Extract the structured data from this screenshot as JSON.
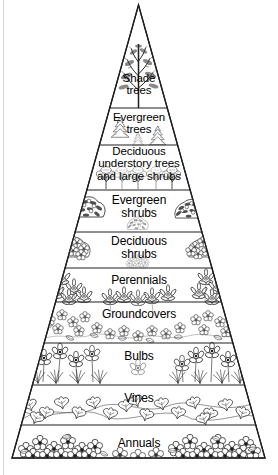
{
  "diagram": {
    "type": "plant-pyramid",
    "orientation": "apex-top",
    "style": "black-and-white line art",
    "stroke_color": "#1a1a1a",
    "fill_color": "#ffffff",
    "text_color": "#000000",
    "tier_count": 10,
    "tiers": [
      {
        "index": 1,
        "label": "Shade\ntrees",
        "label_lines": [
          "Shade",
          "trees"
        ],
        "illustration": "tall-deciduous-tree",
        "font_size": 11.5,
        "text_top": 72,
        "band_top": 5,
        "band_bottom": 108
      },
      {
        "index": 2,
        "label": "Evergreen\ntrees",
        "label_lines": [
          "Evergreen",
          "trees"
        ],
        "illustration": "conifer-evergreen-trees",
        "font_size": 11.5,
        "text_top": 111,
        "band_top": 108,
        "band_bottom": 145
      },
      {
        "index": 3,
        "label": "Deciduous\nunderstory trees\nand large shrubs",
        "label_lines": [
          "Deciduous",
          "understory trees",
          "and large shrubs"
        ],
        "illustration": "understory-trees-large-shrubs",
        "font_size": 11.5,
        "text_top": 145,
        "band_top": 145,
        "band_bottom": 190
      },
      {
        "index": 4,
        "label": "Evergreen\nshrubs",
        "label_lines": [
          "Evergreen",
          "shrubs"
        ],
        "illustration": "broadleaf-evergreen-shrub",
        "font_size": 12,
        "text_top": 194,
        "band_top": 190,
        "band_bottom": 232
      },
      {
        "index": 5,
        "label": "Deciduous\nshrubs",
        "label_lines": [
          "Deciduous",
          "shrubs"
        ],
        "illustration": "flowering-deciduous-shrub",
        "font_size": 12,
        "text_top": 235,
        "band_top": 232,
        "band_bottom": 268
      },
      {
        "index": 6,
        "label": "Perennials",
        "label_lines": [
          "Perennials"
        ],
        "illustration": "daisy-perennial-clumps",
        "font_size": 12,
        "text_top": 274,
        "band_top": 268,
        "band_bottom": 302
      },
      {
        "index": 7,
        "label": "Groundcovers",
        "label_lines": [
          "Groundcovers"
        ],
        "illustration": "low-spreading-groundcover-flowers",
        "font_size": 12,
        "text_top": 308,
        "band_top": 302,
        "band_bottom": 343
      },
      {
        "index": 8,
        "label": "Bulbs",
        "label_lines": [
          "Bulbs"
        ],
        "illustration": "daffodil-bulb-flowers",
        "font_size": 12,
        "text_top": 350,
        "band_top": 343,
        "band_bottom": 385
      },
      {
        "index": 9,
        "label": "Vines",
        "label_lines": [
          "Vines"
        ],
        "illustration": "ivy-vine-leaves",
        "font_size": 12,
        "text_top": 392,
        "band_top": 385,
        "band_bottom": 425
      },
      {
        "index": 10,
        "label": "Annuals",
        "label_lines": [
          "Annuals"
        ],
        "illustration": "annual-bedding-flowers",
        "font_size": 12,
        "text_top": 437,
        "band_top": 425,
        "band_bottom": 458
      }
    ]
  }
}
